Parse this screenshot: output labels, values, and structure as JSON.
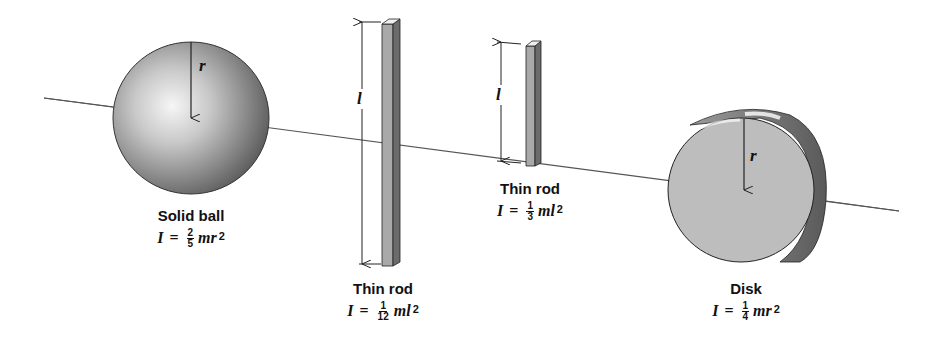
{
  "figure": {
    "axis": {
      "x1": 44,
      "y1": 98,
      "x2": 899,
      "y2": 211,
      "color": "#555555"
    },
    "objects": [
      {
        "id": "solid-ball",
        "name": "Solid ball",
        "dimension_symbol": "r",
        "formula": {
          "lhs": "I",
          "eq": "=",
          "numerator": "2",
          "denominator": "5",
          "vars": "mr",
          "exponent": "2"
        }
      },
      {
        "id": "thin-rod-center",
        "name": "Thin rod",
        "dimension_symbol": "l",
        "formula": {
          "lhs": "I",
          "eq": "=",
          "numerator": "1",
          "denominator": "12",
          "vars": "ml",
          "exponent": "2"
        }
      },
      {
        "id": "thin-rod-end",
        "name": "Thin rod",
        "dimension_symbol": "l",
        "formula": {
          "lhs": "I",
          "eq": "=",
          "numerator": "1",
          "denominator": "3",
          "vars": "ml",
          "exponent": "2"
        }
      },
      {
        "id": "disk",
        "name": "Disk",
        "dimension_symbol": "r",
        "formula": {
          "lhs": "I",
          "eq": "=",
          "numerator": "1",
          "denominator": "4",
          "vars": "mr",
          "exponent": "2"
        }
      }
    ],
    "colors": {
      "line": "#222222",
      "ball_light": "#f4f4f4",
      "ball_mid": "#9a9a9a",
      "ball_dark": "#4a4a4a",
      "rod_front": "#a8a8a8",
      "rod_side": "#6a6a6a",
      "rod_top": "#eeeeee",
      "disk_face": "#bdbdbd",
      "disk_rim": "#6e6e6e"
    }
  }
}
